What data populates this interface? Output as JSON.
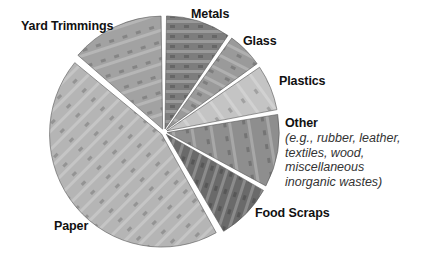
{
  "chart_data": {
    "type": "pie",
    "title": "",
    "style": "exploded pie with photographic grayscale textures",
    "slices": [
      {
        "label": "Metals",
        "value": 9.5,
        "start_deg": 0,
        "end_deg": 35,
        "fill": "#7d7d7d"
      },
      {
        "label": "Glass",
        "value": 5.5,
        "start_deg": 35,
        "end_deg": 55,
        "fill": "#9a9a9a"
      },
      {
        "label": "Plastics",
        "value": 7,
        "start_deg": 55,
        "end_deg": 80,
        "fill": "#c4c4c4"
      },
      {
        "label": "Other",
        "value": 11,
        "start_deg": 80,
        "end_deg": 119,
        "fill": "#8e8e8e"
      },
      {
        "label": "Food Scraps",
        "value": 8.5,
        "start_deg": 119,
        "end_deg": 150,
        "fill": "#6a6a6a"
      },
      {
        "label": "Paper",
        "value": 44.5,
        "start_deg": 150,
        "end_deg": 310,
        "fill": "#b5b5b5"
      },
      {
        "label": "Yard Trimmings",
        "value": 14,
        "start_deg": 310,
        "end_deg": 360,
        "fill": "#a2a2a2"
      }
    ],
    "legend": "none (labels placed adjacent to slices)"
  },
  "labels": {
    "metals": "Metals",
    "glass": "Glass",
    "plastics": "Plastics",
    "other": "Other",
    "other_sub": [
      "(e.g., rubber, leather,",
      "textiles, wood,",
      "miscellaneous",
      "inorganic wastes)"
    ],
    "food": "Food Scraps",
    "paper": "Paper",
    "yard": "Yard Trimmings"
  }
}
